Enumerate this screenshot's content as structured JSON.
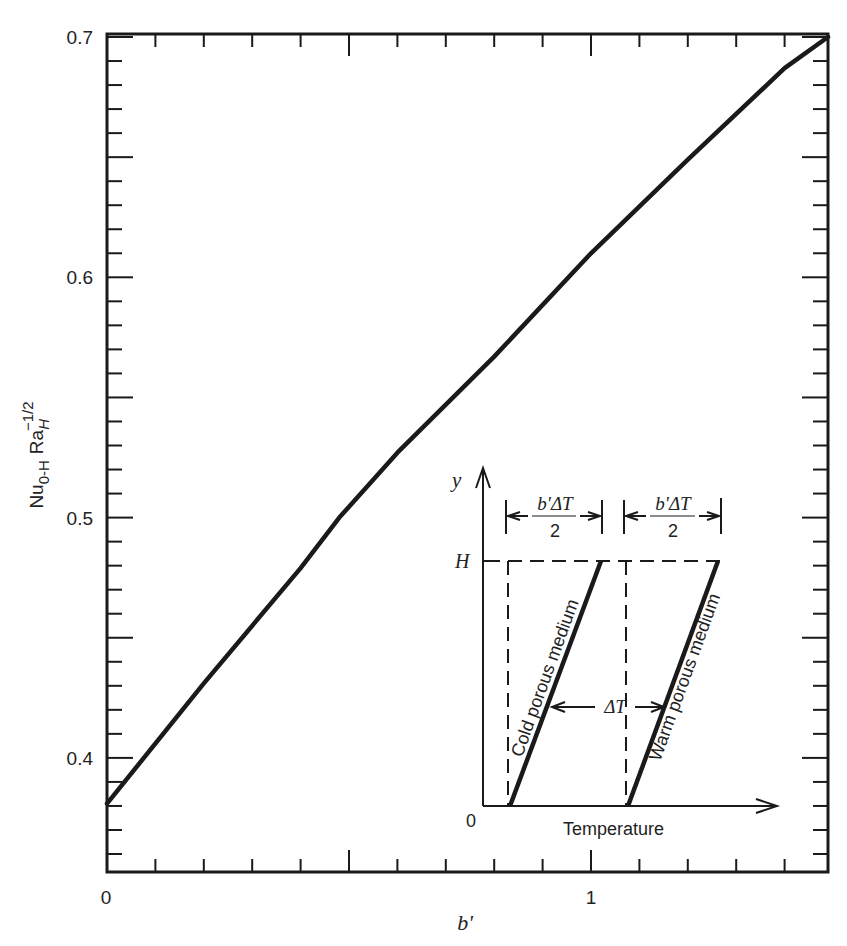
{
  "chart_data": {
    "type": "line",
    "title": "",
    "xlabel": "b'",
    "ylabel": "Nu_{0-H} Ra_H^{-1/2}",
    "xlim": [
      0,
      1.49
    ],
    "ylim": [
      0.35,
      0.7
    ],
    "grid": false,
    "x_ticks": {
      "major": [
        0,
        1
      ],
      "major_labels": [
        "0",
        "1"
      ],
      "minor_step": 0.1,
      "long_tick_at": [
        0.5
      ]
    },
    "y_ticks": {
      "major": [
        0.4,
        0.5,
        0.6,
        0.7
      ],
      "major_labels": [
        "0.4",
        "0.5",
        "0.6",
        "0.7"
      ],
      "minor_step": 0.01,
      "long_tick_every": 0.05
    },
    "series": [
      {
        "name": "Nu Ra^-1/2 vs b'",
        "x": [
          0,
          0.2,
          0.4,
          0.48,
          0.6,
          0.8,
          1.0,
          1.2,
          1.4,
          1.49
        ],
        "y": [
          0.381,
          0.431,
          0.479,
          0.5,
          0.527,
          0.567,
          0.61,
          0.649,
          0.687,
          0.7
        ]
      }
    ],
    "inset": {
      "description": "Schematic of temperature profiles in cold and warm porous media",
      "y_axis_label": "y",
      "y_tick_label": "H",
      "origin_label": "0",
      "x_axis_label": "Temperature",
      "dimension_label_left": {
        "numerator": "b'ΔT",
        "denominator": "2"
      },
      "dimension_label_right": {
        "numerator": "b'ΔT",
        "denominator": "2"
      },
      "delta_label": "ΔT",
      "left_line_label": "Cold porous medium",
      "right_line_label": "Warm porous medium"
    }
  },
  "axes": {
    "y_label_main": "Nu",
    "y_label_sub": "0-H",
    "y_label_ra": "Ra",
    "y_label_ra_sub": "H",
    "y_label_ra_sup": "−1/2",
    "x_label": "b'"
  }
}
